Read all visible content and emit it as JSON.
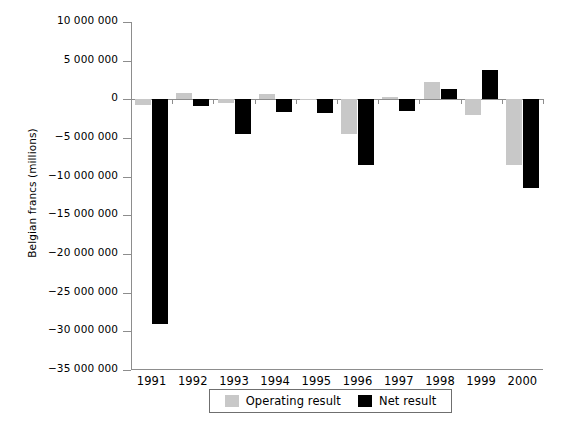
{
  "chart_data": {
    "type": "bar",
    "title": "",
    "subtitle": "",
    "xlabel": "",
    "ylabel": "Belgian francs (millions)",
    "categories": [
      "1991",
      "1992",
      "1993",
      "1994",
      "1995",
      "1996",
      "1997",
      "1998",
      "1999",
      "2000"
    ],
    "series": [
      {
        "name": "Operating result",
        "color": "#c8c8c8",
        "values": [
          -700000,
          800000,
          -500000,
          700000,
          -100000,
          -4500000,
          300000,
          2300000,
          -2000000,
          -8500000
        ]
      },
      {
        "name": "Net result",
        "color": "#000000",
        "values": [
          -29000000,
          -800000,
          -4500000,
          -1600000,
          -1800000,
          -8500000,
          -1500000,
          1300000,
          3800000,
          -11500000
        ]
      }
    ],
    "ylim": [
      -35000000,
      10000000
    ],
    "ytick_values": [
      10000000,
      5000000,
      0,
      -5000000,
      -10000000,
      -15000000,
      -20000000,
      -25000000,
      -30000000,
      -35000000
    ],
    "ytick_labels": [
      "10 000 000",
      "5 000 000",
      "0",
      "−5 000 000",
      "−10 000 000",
      "−15 000 000",
      "−20 000 000",
      "−25 000 000",
      "−30 000 000",
      "−35 000 000"
    ],
    "grid": false,
    "legend_position": "bottom"
  },
  "legend": {
    "entries": [
      {
        "label": "Operating result",
        "color": "#c8c8c8"
      },
      {
        "label": "Net result",
        "color": "#000000"
      }
    ]
  },
  "axes": {
    "y_title": "Belgian francs (millions)"
  }
}
